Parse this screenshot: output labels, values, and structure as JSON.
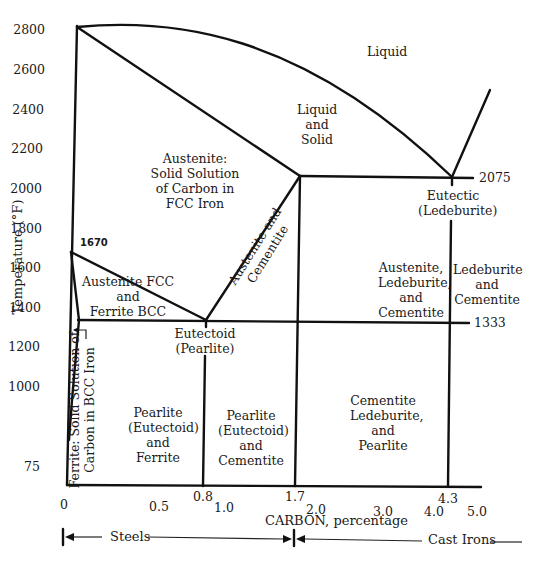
{
  "diagram": {
    "y_axis": {
      "label": "Temperature (°F)",
      "ticks": [
        "2800",
        "2600",
        "2400",
        "2200",
        "2000",
        "1800",
        "1600",
        "1400",
        "1200",
        "1000",
        "75"
      ]
    },
    "x_axis": {
      "label": "CARBON, percentage",
      "ticks": [
        "0",
        "0.5",
        "0.8",
        "1.0",
        "1.7",
        "2.0",
        "3.0",
        "4.0",
        "4.3",
        "5.0"
      ]
    },
    "point_labels": {
      "t1670": "1670",
      "t2075": "2075",
      "t1333": "1333"
    },
    "regions": {
      "liquid": "Liquid",
      "liquid_solid": [
        "Liquid",
        "and",
        "Solid"
      ],
      "austenite": [
        "Austenite:",
        "Solid Solution",
        "of Carbon in",
        "FCC Iron"
      ],
      "austenite_ferrite": [
        "Austenite FCC",
        "and",
        "Ferrite BCC"
      ],
      "austenite_cementite": [
        "Austenite and",
        "Cementite"
      ],
      "eutectic": [
        "Eutectic",
        "(Ledeburite)"
      ],
      "eutectoid": [
        "Eutectoid",
        "(Pearlite)"
      ],
      "aus_led_cem": [
        "Austenite,",
        "Ledeburite,",
        "and",
        "Cementite"
      ],
      "led_cem": [
        "Ledeburite",
        "and",
        "Cementite"
      ],
      "ferrite": [
        "Ferrite: Solid Solution of",
        "Carbon in BCC Iron"
      ],
      "pearlite_ferrite": [
        "Pearlite",
        "(Eutectoid)",
        "and",
        "Ferrite"
      ],
      "pearlite_cementite": [
        "Pearlite",
        "(Eutectoid)",
        "and",
        "Cementite"
      ],
      "cem_led_pearl": [
        "Cementite",
        "Ledeburite,",
        "and",
        "Pearlite"
      ]
    },
    "ranges": {
      "steels": "Steels",
      "cast_irons": "Cast Irons"
    }
  }
}
